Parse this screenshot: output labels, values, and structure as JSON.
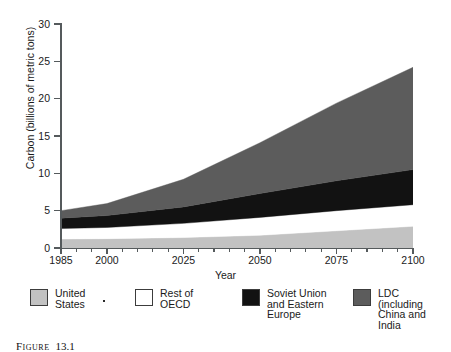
{
  "chart_data": {
    "type": "area",
    "title": "",
    "xlabel": "Year",
    "ylabel": "Carbon (billions of metric tons)",
    "xlim": [
      1985,
      2100
    ],
    "ylim": [
      0,
      30
    ],
    "xticks": [
      1985,
      2000,
      2025,
      2050,
      2075,
      2100
    ],
    "yticks": [
      0,
      5,
      10,
      15,
      20,
      25,
      30
    ],
    "grid": false,
    "stacked": true,
    "legend_position": "below-axis",
    "x": [
      1985,
      2000,
      2025,
      2050,
      2075,
      2100
    ],
    "series": [
      {
        "name": "United States",
        "color": "#c2c2c2",
        "values": [
          1.2,
          1.25,
          1.4,
          1.7,
          2.3,
          2.9
        ]
      },
      {
        "name": "Rest of OECD",
        "color": "#ffffff",
        "values": [
          1.4,
          1.5,
          1.9,
          2.4,
          2.7,
          2.9
        ]
      },
      {
        "name": "Soviet Union and Eastern Europe",
        "color": "#121212",
        "values": [
          1.4,
          1.6,
          2.2,
          3.2,
          4.0,
          4.7
        ]
      },
      {
        "name": "LDC (including China and India",
        "color": "#5c5c5c",
        "values": [
          1.0,
          1.6,
          3.7,
          6.8,
          10.4,
          13.7
        ]
      }
    ],
    "cumulative_top": [
      5.0,
      5.95,
      9.2,
      14.1,
      19.4,
      24.2
    ]
  },
  "axes": {
    "y_title": "Carbon (billions of metric tons)",
    "x_title": "Year",
    "y_tick_labels": [
      "0",
      "5",
      "10",
      "15",
      "20",
      "25",
      "30"
    ],
    "x_tick_labels": [
      "1985",
      "2000",
      "2025",
      "2050",
      "2075",
      "2100"
    ]
  },
  "legend": {
    "items": [
      {
        "label": "United\nStates",
        "color": "#c2c2c2",
        "swatch": "legend-swatch-united-states"
      },
      {
        "label": "Rest of\nOECD",
        "color": "#ffffff",
        "swatch": "legend-swatch-rest-of-oecd"
      },
      {
        "label": "Soviet Union\nand Eastern\nEurope",
        "color": "#121212",
        "swatch": "legend-swatch-soviet-union"
      },
      {
        "label": "LDC\n(including\nChina and\nIndia",
        "color": "#5c5c5c",
        "swatch": "legend-swatch-ldc"
      }
    ]
  },
  "caption": {
    "label": "Figure",
    "number": "13.1",
    "text": ""
  },
  "colors": {
    "axis": "#555a5c",
    "text": "#1a1a1a",
    "background": "#ffffff"
  }
}
